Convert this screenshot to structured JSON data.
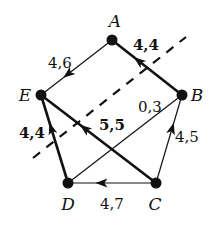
{
  "diagram": {
    "type": "directed-graph",
    "colors": {
      "ink": "#111111",
      "background": "#ffffff"
    },
    "nodes": [
      {
        "id": "A",
        "label": "A",
        "x": 112,
        "y": 40,
        "lx": 115,
        "ly": 27
      },
      {
        "id": "B",
        "label": "B",
        "x": 182,
        "y": 95,
        "lx": 197,
        "ly": 101
      },
      {
        "id": "C",
        "label": "C",
        "x": 156,
        "y": 183,
        "lx": 155,
        "ly": 210
      },
      {
        "id": "D",
        "label": "D",
        "x": 68,
        "y": 183,
        "lx": 68,
        "ly": 210
      },
      {
        "id": "E",
        "label": "E",
        "x": 41,
        "y": 95,
        "lx": 25,
        "ly": 101
      }
    ],
    "edges": [
      {
        "from": "A",
        "to": "E",
        "label": "4,6",
        "bold": false,
        "arrow": true,
        "lx": 60,
        "ly": 68
      },
      {
        "from": "B",
        "to": "A",
        "label": "4,4",
        "bold": true,
        "arrow": true,
        "lx": 146,
        "ly": 50
      },
      {
        "from": "C",
        "to": "B",
        "label": "4,5",
        "bold": false,
        "arrow": true,
        "lx": 187,
        "ly": 142
      },
      {
        "from": "C",
        "to": "D",
        "label": "4,7",
        "bold": false,
        "arrow": true,
        "lx": 112,
        "ly": 209
      },
      {
        "from": "D",
        "to": "E",
        "label": "4,4",
        "bold": true,
        "arrow": true,
        "lx": 32,
        "ly": 138
      },
      {
        "from": "C",
        "to": "E",
        "label": "5,5",
        "bold": true,
        "arrow": true,
        "lx": 112,
        "ly": 130
      },
      {
        "from": "D",
        "to": "B",
        "label": "0,3",
        "bold": false,
        "arrow": false,
        "lx": 150,
        "ly": 112
      }
    ],
    "cut_line": {
      "x1": 33,
      "y1": 158,
      "x2": 186,
      "y2": 37,
      "style": "dashed"
    }
  }
}
